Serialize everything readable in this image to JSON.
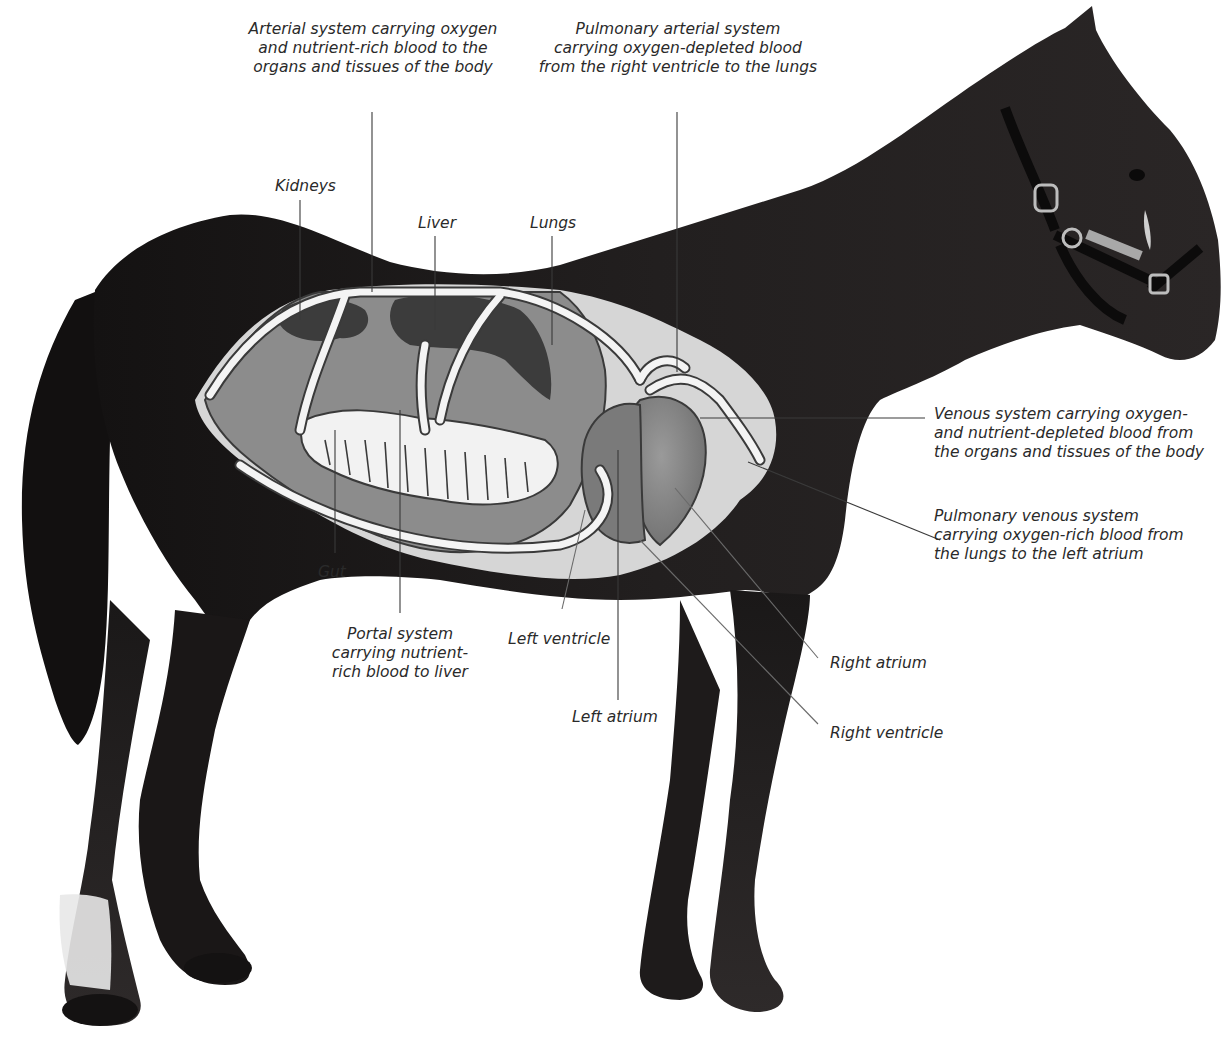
{
  "labels": {
    "arterial": {
      "lines": [
        "Arterial system carrying oxygen",
        "and nutrient-rich blood to the",
        "organs and tissues of the body"
      ]
    },
    "pulmonary_arterial": {
      "lines": [
        "Pulmonary arterial system",
        "carrying oxygen-depleted blood",
        "from the right ventricle to the lungs"
      ]
    },
    "kidneys": {
      "text": "Kidneys"
    },
    "liver": {
      "text": "Liver"
    },
    "lungs": {
      "text": "Lungs"
    },
    "venous": {
      "lines": [
        "Venous system carrying oxygen-",
        "and nutrient-depleted blood from",
        "the organs and tissues of the body"
      ]
    },
    "pulmonary_venous": {
      "lines": [
        "Pulmonary venous system",
        "carrying oxygen-rich blood from",
        "the lungs to the left atrium"
      ]
    },
    "gut": {
      "text": "Gut"
    },
    "portal": {
      "lines": [
        "Portal system",
        "carrying nutrient-",
        "rich blood to liver"
      ]
    },
    "left_ventricle": {
      "text": "Left ventricle"
    },
    "left_atrium": {
      "text": "Left atrium"
    },
    "right_atrium": {
      "text": "Right atrium"
    },
    "right_ventricle": {
      "text": "Right ventricle"
    }
  },
  "colors": {
    "background": "#ffffff",
    "horse_coat": "#1c1a1a",
    "horse_highlight": "#3a3636",
    "overlay_light": "#d4d4d4",
    "organ_mid": "#8a8a8a",
    "organ_dark": "#3c3c3c",
    "vessel": "#f4f4f4",
    "text": "#2a2a2a"
  }
}
